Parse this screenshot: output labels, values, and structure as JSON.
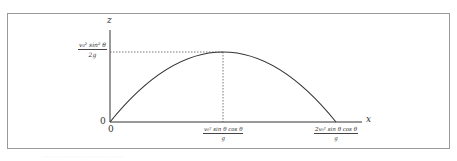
{
  "diagram": {
    "type": "projectile-trajectory",
    "axes": {
      "x_label": "x",
      "z_label": "z",
      "origin_x_label": "0",
      "origin_z_label": "0"
    },
    "annotations": {
      "max_height": {
        "numerator": "v₀² sin² θ",
        "denominator": "2g"
      },
      "x_at_peak": {
        "numerator": "v₀² sin θ cos θ",
        "denominator": "g"
      },
      "range": {
        "numerator": "2v₀² sin θ cos θ",
        "denominator": "g"
      }
    },
    "curve": {
      "shape": "parabola",
      "start": [
        0,
        0
      ],
      "peak": [
        1,
        1
      ],
      "end": [
        2,
        0
      ],
      "color": "#333333"
    },
    "guides": {
      "style": "dotted",
      "color": "#555555"
    },
    "frame_color": "#9a9a9a"
  },
  "caption": {
    "text": "··································"
  }
}
